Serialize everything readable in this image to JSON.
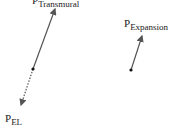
{
  "diagram": {
    "type": "vector-diagram",
    "colors": {
      "stroke": "#555555",
      "dot": "#111111",
      "text": "#222222",
      "background": "#ffffff"
    },
    "labels": {
      "transmural": {
        "main": "P",
        "sub": "Transmural"
      },
      "el": {
        "main": "P",
        "sub": "EL"
      },
      "expansion": {
        "main": "P",
        "sub": "Expansion"
      }
    },
    "vectors": [
      {
        "name": "P_Transmural",
        "style": "solid",
        "from": [
          33,
          69
        ],
        "to": [
          55,
          8
        ]
      },
      {
        "name": "P_EL",
        "style": "dotted",
        "from": [
          33,
          69
        ],
        "to": [
          21,
          106
        ]
      },
      {
        "name": "P_Expansion",
        "style": "solid",
        "from": [
          131,
          70
        ],
        "to": [
          142,
          35
        ]
      }
    ]
  }
}
